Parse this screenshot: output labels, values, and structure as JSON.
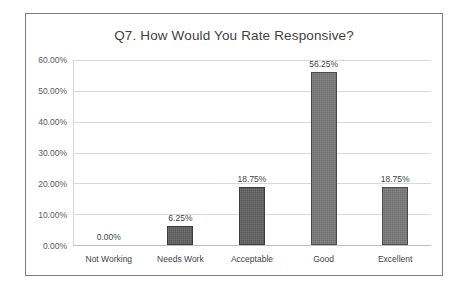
{
  "chart_data": {
    "type": "bar",
    "title": "Q7. How Would You Rate Responsive?",
    "xlabel": "",
    "ylabel": "",
    "categories": [
      "Not Working",
      "Needs  Work",
      "Acceptable",
      "Good",
      "Excellent"
    ],
    "values": [
      0.0,
      6.25,
      18.75,
      56.25,
      18.75
    ],
    "data_labels": [
      "0.00%",
      "6.25%",
      "18.75%",
      "56.25%",
      "18.75%"
    ],
    "ylim": [
      0,
      60
    ],
    "ytick_values": [
      0,
      10,
      20,
      30,
      40,
      50,
      60
    ],
    "ytick_labels": [
      "0.00%",
      "10.00%",
      "20.00%",
      "30.00%",
      "40.00%",
      "50.00%",
      "60.00%"
    ],
    "grid": true,
    "legend": false,
    "series": [
      {
        "name": "Responses",
        "values": [
          0.0,
          6.25,
          18.75,
          56.25,
          18.75
        ]
      }
    ],
    "colors": {
      "bar_dark": "#565656",
      "bar_light": "#6e6e6e",
      "bar_border": "#3b3b3b",
      "gridline": "#d9d9d9",
      "axis": "#bfbfbf",
      "title_text": "#3f3f3f",
      "tick_text": "#595959",
      "frame_border": "#7d7d7d",
      "background": "#ffffff"
    }
  }
}
